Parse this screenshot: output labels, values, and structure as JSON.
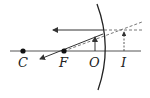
{
  "diagram": {
    "type": "convex-mirror-ray-diagram",
    "labels": {
      "center_of_curvature": "C",
      "focal_point": "F",
      "object": "O",
      "image": "I"
    },
    "colors": {
      "line": "#333333",
      "background": "#ffffff"
    }
  }
}
